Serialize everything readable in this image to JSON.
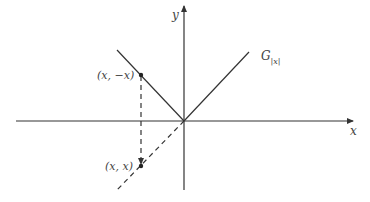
{
  "diagram": {
    "type": "graph-of-absolute-value",
    "axes": {
      "x_label": "x",
      "y_label": "y"
    },
    "graph_label": {
      "main": "G",
      "subscript": "|x|"
    },
    "points": [
      {
        "label": "(x, −x)",
        "description": "point on graph at negative x"
      },
      {
        "label": "(x, x)",
        "description": "reflected point on dashed line y=x"
      }
    ],
    "colors": {
      "stroke": "#333333",
      "text": "#444444",
      "background": "#ffffff"
    }
  }
}
